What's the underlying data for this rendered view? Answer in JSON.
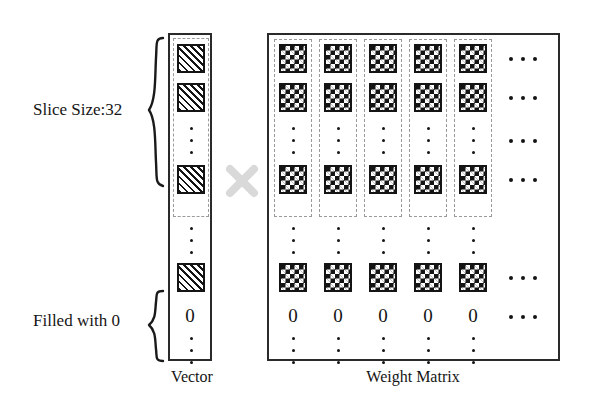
{
  "diagram": {
    "title_vector": "Vector",
    "title_matrix": "Weight Matrix",
    "annotations": {
      "slice_size": "Slice Size:32",
      "filled_with_zero": "Filled with 0"
    },
    "operator": {
      "symbol": "×",
      "name": "multiply-icon",
      "color": "#d9d9d9"
    },
    "colors": {
      "ink": "#141414",
      "border": "#2a2a2a",
      "dashed": "#9a9a9a",
      "background": "#ffffff",
      "operator": "#d9d9d9"
    },
    "vector": {
      "label": "Vector",
      "slice_label": "Slice Size:32",
      "padding_label": "Filled with 0",
      "cells": [
        {
          "kind": "hatched",
          "in_slice": true
        },
        {
          "kind": "hatched",
          "in_slice": true
        },
        {
          "kind": "vertical-ellipsis",
          "in_slice": true
        },
        {
          "kind": "hatched",
          "in_slice": true
        },
        {
          "kind": "vertical-ellipsis",
          "in_slice": false
        },
        {
          "kind": "hatched",
          "in_slice": false
        },
        {
          "kind": "zero",
          "value": "0",
          "in_slice": false
        },
        {
          "kind": "vertical-ellipsis",
          "in_slice": false
        }
      ]
    },
    "matrix": {
      "label": "Weight Matrix",
      "visible_columns": 5,
      "column_overflow": "···",
      "rows": [
        {
          "kind": "checkerboard",
          "in_slice": true,
          "overflow": true
        },
        {
          "kind": "checkerboard",
          "in_slice": true,
          "overflow": true
        },
        {
          "kind": "vertical-ellipsis",
          "in_slice": true,
          "overflow": true
        },
        {
          "kind": "checkerboard",
          "in_slice": true,
          "overflow": true
        },
        {
          "kind": "vertical-ellipsis",
          "in_slice": false,
          "overflow": false
        },
        {
          "kind": "checkerboard",
          "in_slice": false,
          "overflow": true
        },
        {
          "kind": "zero",
          "value": "0",
          "in_slice": false,
          "overflow": true
        },
        {
          "kind": "vertical-ellipsis",
          "in_slice": false,
          "overflow": false
        }
      ],
      "zero_values": [
        "0",
        "0",
        "0",
        "0",
        "0"
      ]
    }
  }
}
